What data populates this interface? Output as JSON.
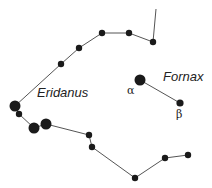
{
  "diagram": {
    "type": "constellation-map",
    "line_color": "#555555",
    "star_color": "#1a1a1a",
    "constellations": [
      {
        "name": "Eridanus",
        "label_pos": [
          37,
          85
        ],
        "stars": [
          {
            "x": 156,
            "y": 9,
            "r": 0
          },
          {
            "x": 153,
            "y": 42,
            "r": 3.2
          },
          {
            "x": 129,
            "y": 33,
            "r": 3.2
          },
          {
            "x": 102,
            "y": 33,
            "r": 3.2
          },
          {
            "x": 79,
            "y": 48,
            "r": 3.2
          },
          {
            "x": 61,
            "y": 64,
            "r": 3.2
          },
          {
            "x": 15,
            "y": 106,
            "r": 5.5
          },
          {
            "x": 19,
            "y": 114,
            "r": 3.2
          },
          {
            "x": 34,
            "y": 128,
            "r": 5.5
          },
          {
            "x": 46,
            "y": 124,
            "r": 5.5
          },
          {
            "x": 89,
            "y": 135,
            "r": 3.2
          },
          {
            "x": 92,
            "y": 147,
            "r": 3.2
          },
          {
            "x": 135,
            "y": 178,
            "r": 3.2
          },
          {
            "x": 165,
            "y": 158,
            "r": 3.2
          },
          {
            "x": 188,
            "y": 155,
            "r": 3.2
          }
        ]
      },
      {
        "name": "Fornax",
        "label_pos": [
          163,
          69
        ],
        "stars": [
          {
            "x": 140,
            "y": 80,
            "r": 5.5,
            "designation": "α",
            "label_pos": [
              127,
              85
            ]
          },
          {
            "x": 180,
            "y": 103,
            "r": 3.6,
            "designation": "β",
            "label_pos": [
              176,
              108
            ]
          }
        ]
      }
    ]
  }
}
